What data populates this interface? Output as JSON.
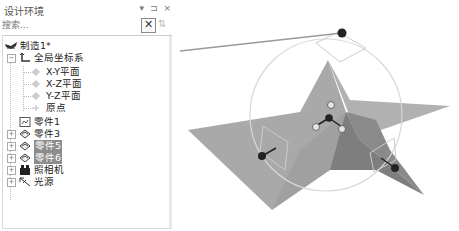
{
  "panel": {
    "title": "设计环境",
    "buttons": {
      "dropdown": "▾",
      "pin": "⊐",
      "close": "×"
    },
    "search": {
      "placeholder": "搜索...",
      "value": "",
      "clear_label": "✕",
      "option_icon": "⇅"
    }
  },
  "tree": {
    "root": {
      "label": "制造1*",
      "icon": "workshop-icon"
    },
    "coord_system": {
      "label": "全局坐标系",
      "expanded": true,
      "children": [
        {
          "label": "X-Y平面",
          "icon": "plane-icon"
        },
        {
          "label": "X-Z平面",
          "icon": "plane-icon"
        },
        {
          "label": "Y-Z平面",
          "icon": "plane-icon"
        },
        {
          "label": "原点",
          "icon": "origin-icon"
        }
      ]
    },
    "items": [
      {
        "label": "零件1",
        "icon": "part-image-icon",
        "expander": false,
        "selected": false
      },
      {
        "label": "零件3",
        "icon": "part-icon",
        "expander": true,
        "selected": false
      },
      {
        "label": "零件5",
        "icon": "part-icon",
        "expander": true,
        "selected": true
      },
      {
        "label": "零件6",
        "icon": "part-icon",
        "expander": true,
        "selected": true
      },
      {
        "label": "照相机",
        "icon": "camera-icon",
        "expander": true,
        "selected": false
      },
      {
        "label": "光源",
        "icon": "light-icon",
        "expander": true,
        "selected": false
      }
    ]
  },
  "viewport": {
    "object": "star-shape",
    "colors": {
      "star_light": "#a8a8a8",
      "star_dark": "#7c7c7c",
      "gizmo_ring": "#d8d8d8",
      "handle": "#222222"
    }
  }
}
